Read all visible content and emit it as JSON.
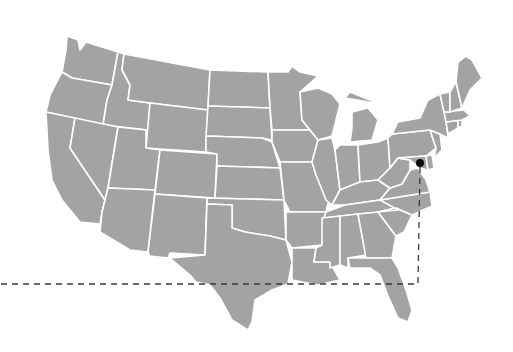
{
  "map": {
    "region": "Contiguous United States",
    "style": {
      "land_color": "#a3a3a3",
      "border_color": "#ffffff",
      "background_color": "#ffffff",
      "marker_color": "#0a0a0a",
      "leader_line_color": "#3a3a3a"
    },
    "marker": {
      "shape": "filled-circle",
      "approx_location": "Washington DC / Maryland area",
      "pixel_x": 420,
      "pixel_y": 163,
      "radius": 4
    },
    "leader_line": {
      "style": "dashed",
      "points": [
        [
          420,
          167
        ],
        [
          418,
          284
        ],
        [
          0,
          284
        ]
      ]
    }
  }
}
